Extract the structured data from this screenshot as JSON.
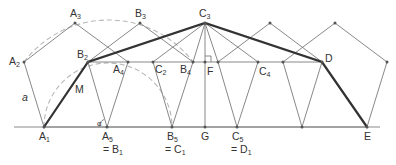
{
  "figure": {
    "baseline": {
      "y": 127,
      "x_start": 14,
      "x_end": 380
    },
    "pentagons": [
      {
        "name": "A",
        "vertices": [
          [
            44,
            127
          ],
          [
            24,
            62
          ],
          [
            75,
            23
          ],
          [
            128,
            62
          ],
          [
            107,
            127
          ]
        ]
      },
      {
        "name": "B",
        "vertices": [
          [
            107,
            127
          ],
          [
            88,
            62
          ],
          [
            140,
            23
          ],
          [
            193,
            62
          ],
          [
            172,
            127
          ]
        ]
      },
      {
        "name": "C",
        "vertices": [
          [
            172,
            127
          ],
          [
            153,
            62
          ],
          [
            205,
            23
          ],
          [
            258,
            62
          ],
          [
            237,
            127
          ]
        ]
      },
      {
        "name": "D",
        "vertices": [
          [
            237,
            127
          ],
          [
            218,
            62
          ],
          [
            270,
            23
          ],
          [
            322,
            62
          ],
          [
            302,
            127
          ]
        ]
      },
      {
        "name": "E",
        "vertices": [
          [
            302,
            127
          ],
          [
            283,
            62
          ],
          [
            335,
            23
          ],
          [
            387,
            62
          ],
          [
            367,
            127
          ]
        ]
      }
    ],
    "thick_path": [
      [
        44,
        127
      ],
      [
        88,
        62
      ],
      [
        205,
        23
      ],
      [
        322,
        62
      ],
      [
        367,
        127
      ]
    ],
    "labels": {
      "A1": {
        "base": "A",
        "sub": "1"
      },
      "A2": {
        "base": "A",
        "sub": "2"
      },
      "A3": {
        "base": "A",
        "sub": "3"
      },
      "A4": {
        "base": "A",
        "sub": "4"
      },
      "A5": {
        "base": "A",
        "sub": "5"
      },
      "B1_eq": {
        "prefix": "= B",
        "sub": "1"
      },
      "B2": {
        "base": "B",
        "sub": "2"
      },
      "B3": {
        "base": "B",
        "sub": "3"
      },
      "B4": {
        "base": "B",
        "sub": "4"
      },
      "B5": {
        "base": "B",
        "sub": "5"
      },
      "C1_eq": {
        "prefix": "= C",
        "sub": "1"
      },
      "C2": {
        "base": "C",
        "sub": "2"
      },
      "C3": {
        "base": "C",
        "sub": "3"
      },
      "C4": {
        "base": "C",
        "sub": "4"
      },
      "C5": {
        "base": "C",
        "sub": "5"
      },
      "D1_eq": {
        "prefix": "= D",
        "sub": "1"
      },
      "D": "D",
      "E": "E",
      "F": "F",
      "G": "G",
      "M": "M",
      "a": "a",
      "alpha": "α"
    }
  }
}
